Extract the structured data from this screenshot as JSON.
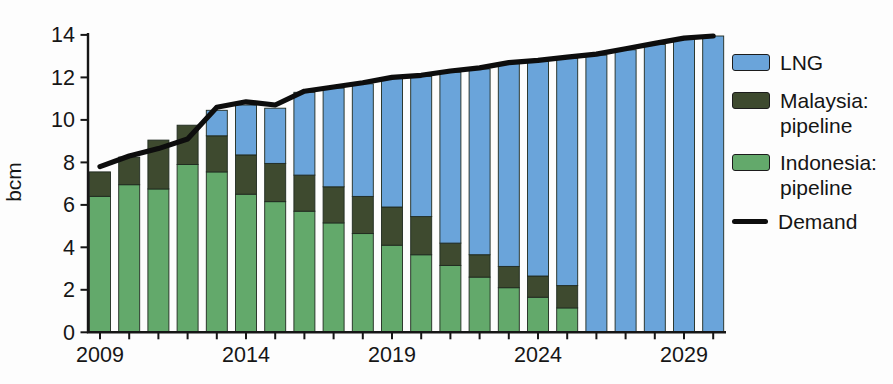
{
  "colors": {
    "lng": "#6AA4DA",
    "malaysia": "#3E4A2F",
    "indonesia": "#63A96B",
    "demand": "#0d0d0d",
    "axis": "#161616",
    "bar_outline": "#1f2a1f"
  },
  "legend": {
    "items": [
      {
        "label": "LNG",
        "label2": ""
      },
      {
        "label": "Malaysia:",
        "label2": "pipeline"
      },
      {
        "label": "Indonesia:",
        "label2": "pipeline"
      },
      {
        "label": "Demand",
        "label2": ""
      }
    ]
  },
  "chart_data": {
    "type": "bar",
    "subtype": "stacked-bars-with-line-overlay",
    "title": "",
    "xlabel": "",
    "ylabel": "bcm",
    "ylim": [
      0,
      14
    ],
    "yticks": [
      0,
      2,
      4,
      6,
      8,
      10,
      12,
      14
    ],
    "grid": false,
    "legend_position": "right",
    "categories": [
      2009,
      2010,
      2011,
      2012,
      2013,
      2014,
      2015,
      2016,
      2017,
      2018,
      2019,
      2020,
      2021,
      2022,
      2023,
      2024,
      2025,
      2026,
      2027,
      2028,
      2029,
      2030
    ],
    "x_tick_labels_shown": [
      "2009",
      "2014",
      "2019",
      "2024",
      "2029"
    ],
    "series": [
      {
        "name": "Indonesia: pipeline",
        "role": "stack",
        "color_key": "indonesia",
        "values": [
          6.4,
          6.95,
          6.75,
          7.9,
          7.55,
          6.5,
          6.15,
          5.7,
          5.15,
          4.65,
          4.1,
          3.65,
          3.15,
          2.6,
          2.1,
          1.65,
          1.15,
          0,
          0,
          0,
          0,
          0
        ]
      },
      {
        "name": "Malaysia: pipeline",
        "role": "stack",
        "color_key": "malaysia",
        "values": [
          1.15,
          1.3,
          2.3,
          1.85,
          1.7,
          1.85,
          1.8,
          1.7,
          1.7,
          1.75,
          1.8,
          1.8,
          1.05,
          1.05,
          1.0,
          1.0,
          1.05,
          0,
          0,
          0,
          0,
          0
        ]
      },
      {
        "name": "LNG",
        "role": "stack",
        "color_key": "lng",
        "values": [
          0,
          0,
          0,
          0,
          1.2,
          2.35,
          2.6,
          3.9,
          4.65,
          5.3,
          6.05,
          6.6,
          8.05,
          8.75,
          9.55,
          10.1,
          10.7,
          13.05,
          13.3,
          13.55,
          13.8,
          13.95
        ]
      },
      {
        "name": "Demand",
        "role": "line",
        "color_key": "demand",
        "values": [
          7.8,
          8.3,
          8.65,
          9.1,
          10.6,
          10.85,
          10.7,
          11.35,
          11.55,
          11.75,
          12.0,
          12.1,
          12.3,
          12.45,
          12.7,
          12.8,
          12.95,
          13.1,
          13.35,
          13.6,
          13.85,
          13.95
        ]
      }
    ]
  }
}
